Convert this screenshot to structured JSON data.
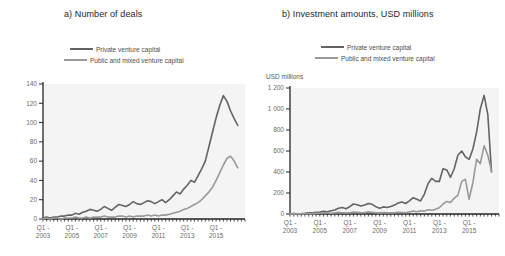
{
  "figure": {
    "background": "#ffffff",
    "plot_background": "#f4f4f5",
    "axis_color": "#262626"
  },
  "chart_data": [
    {
      "id": "number-of-deals",
      "type": "line",
      "title": "a) Number of deals",
      "xlabel": "",
      "ylabel": "",
      "ylim": [
        0,
        140
      ],
      "grid": false,
      "legend_position": "top",
      "x_unit": "quarter",
      "x_range": "2003 Q1 to 2016 Q3",
      "yticks": [
        {
          "value": 0,
          "label": "0"
        },
        {
          "value": 20,
          "label": "20"
        },
        {
          "value": 40,
          "label": "40"
        },
        {
          "value": 60,
          "label": "60"
        },
        {
          "value": 80,
          "label": "80"
        },
        {
          "value": 100,
          "label": "100"
        },
        {
          "value": 120,
          "label": "120"
        },
        {
          "value": 140,
          "label": "140"
        }
      ],
      "xticks": [
        {
          "index": 0,
          "line1": "Q1 -",
          "line2": "2003"
        },
        {
          "index": 8,
          "line1": "Q1 -",
          "line2": "2005"
        },
        {
          "index": 16,
          "line1": "Q1 -",
          "line2": "2007"
        },
        {
          "index": 24,
          "line1": "Q1 -",
          "line2": "2009"
        },
        {
          "index": 32,
          "line1": "Q1 -",
          "line2": "2011"
        },
        {
          "index": 40,
          "line1": "Q1 -",
          "line2": "2013"
        },
        {
          "index": 48,
          "line1": "Q1 -",
          "line2": "2015"
        }
      ],
      "series": [
        {
          "name": "Private venture capital",
          "color": "#636466",
          "values": [
            1,
            2,
            1,
            2,
            2,
            3,
            3,
            4,
            4,
            6,
            5,
            7,
            8,
            10,
            9,
            8,
            10,
            13,
            11,
            9,
            12,
            15,
            14,
            13,
            15,
            18,
            16,
            15,
            17,
            19,
            18,
            16,
            18,
            20,
            17,
            20,
            24,
            28,
            26,
            31,
            35,
            40,
            38,
            45,
            52,
            60,
            75,
            90,
            105,
            118,
            128,
            122,
            112,
            104,
            97
          ]
        },
        {
          "name": "Public and mixed venture capital",
          "color": "#97999c",
          "values": [
            0,
            1,
            0,
            1,
            1,
            0,
            1,
            1,
            1,
            2,
            1,
            1,
            2,
            1,
            2,
            2,
            2,
            3,
            2,
            2,
            2,
            3,
            3,
            2,
            3,
            2,
            3,
            3,
            3,
            4,
            3,
            4,
            3,
            4,
            4,
            5,
            6,
            7,
            8,
            10,
            11,
            13,
            15,
            17,
            20,
            24,
            28,
            33,
            40,
            48,
            56,
            63,
            65,
            60,
            53
          ]
        }
      ]
    },
    {
      "id": "investment-amounts",
      "type": "line",
      "title": "b) Investment amounts, USD millions",
      "xlabel": "",
      "ylabel": "USD millions",
      "ylim": [
        0,
        1200
      ],
      "grid": false,
      "legend_position": "top",
      "x_unit": "quarter",
      "x_range": "2003 Q1 to 2016 Q3",
      "yticks": [
        {
          "value": 0,
          "label": "0"
        },
        {
          "value": 200,
          "label": "200"
        },
        {
          "value": 400,
          "label": "400"
        },
        {
          "value": 600,
          "label": "600"
        },
        {
          "value": 800,
          "label": "800"
        },
        {
          "value": 1000,
          "label": "1 000"
        },
        {
          "value": 1200,
          "label": "1 200"
        }
      ],
      "xticks": [
        {
          "index": 0,
          "line1": "Q1 -",
          "line2": "2003"
        },
        {
          "index": 8,
          "line1": "Q1 -",
          "line2": "2005"
        },
        {
          "index": 16,
          "line1": "Q1 -",
          "line2": "2007"
        },
        {
          "index": 24,
          "line1": "Q1 -",
          "line2": "2009"
        },
        {
          "index": 32,
          "line1": "Q1 -",
          "line2": "2011"
        },
        {
          "index": 40,
          "line1": "Q1 -",
          "line2": "2013"
        },
        {
          "index": 48,
          "line1": "Q1 -",
          "line2": "2015"
        }
      ],
      "series": [
        {
          "name": "Private venture capital",
          "color": "#636466",
          "values": [
            2,
            4,
            3,
            5,
            8,
            12,
            10,
            15,
            18,
            26,
            22,
            30,
            38,
            55,
            62,
            50,
            70,
            95,
            88,
            75,
            85,
            100,
            92,
            70,
            55,
            68,
            62,
            72,
            85,
            105,
            115,
            100,
            125,
            155,
            140,
            125,
            190,
            290,
            340,
            310,
            310,
            430,
            420,
            350,
            430,
            560,
            600,
            545,
            520,
            620,
            780,
            1000,
            1130,
            950,
            400
          ]
        },
        {
          "name": "Public and mixed venture capital",
          "color": "#97999c",
          "values": [
            1,
            2,
            1,
            2,
            3,
            5,
            4,
            6,
            8,
            12,
            10,
            8,
            10,
            15,
            12,
            10,
            12,
            18,
            15,
            12,
            14,
            20,
            16,
            12,
            10,
            14,
            12,
            10,
            12,
            16,
            14,
            12,
            18,
            28,
            22,
            30,
            28,
            40,
            35,
            45,
            60,
            95,
            120,
            110,
            150,
            180,
            310,
            330,
            140,
            300,
            520,
            480,
            650,
            560,
            410
          ]
        }
      ]
    }
  ]
}
